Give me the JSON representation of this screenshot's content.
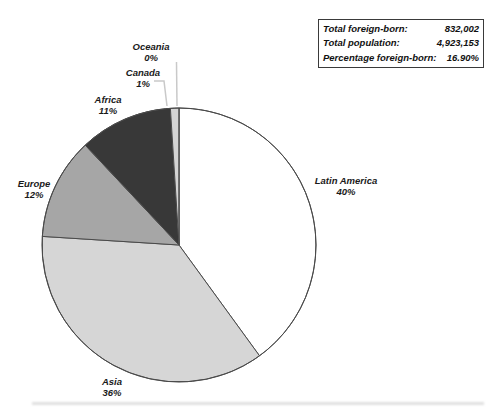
{
  "info_box": {
    "rows": [
      {
        "label": "Total foreign-born:",
        "value": "832,002"
      },
      {
        "label": "Total population:",
        "value": "4,923,153"
      },
      {
        "label": "Percentage foreign-born:",
        "value": "16.90%"
      }
    ]
  },
  "chart_data": {
    "type": "pie",
    "title": "",
    "start_angle_deg": 0,
    "direction": "clockwise",
    "legend_position": "none",
    "outline_color": "#4a4a4a",
    "leader_line_color": "#c9c9c9",
    "label_color": "#1a1a1a",
    "slices": [
      {
        "label": "Latin America",
        "value": 40,
        "pct_label": "40%",
        "fill": "#ffffff"
      },
      {
        "label": "Asia",
        "value": 36,
        "pct_label": "36%",
        "fill": "#d6d6d6"
      },
      {
        "label": "Europe",
        "value": 12,
        "pct_label": "12%",
        "fill": "#a6a6a6"
      },
      {
        "label": "Africa",
        "value": 11,
        "pct_label": "11%",
        "fill": "#383838"
      },
      {
        "label": "Canada",
        "value": 1,
        "pct_label": "1%",
        "fill": "#d4d4d4"
      },
      {
        "label": "Oceania",
        "value": 0,
        "pct_label": "0%",
        "fill": "#ffffff"
      }
    ]
  }
}
